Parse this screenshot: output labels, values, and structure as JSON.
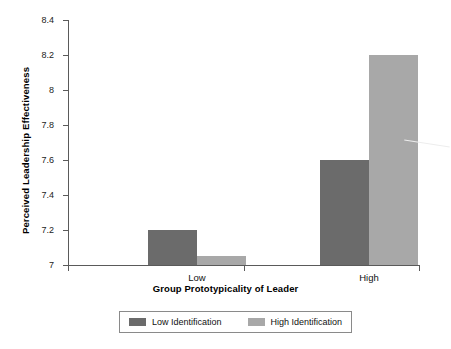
{
  "chart_data": {
    "type": "bar",
    "title": "",
    "xlabel": "Group Prototypicality of Leader",
    "ylabel": "Perceived Leadership Effectiveness",
    "categories": [
      "Low",
      "High"
    ],
    "series": [
      {
        "name": "Low Identification",
        "color": "#6b6b6b",
        "values": [
          7.2,
          7.6
        ]
      },
      {
        "name": "High Identification",
        "color": "#a8a8a8",
        "values": [
          7.05,
          8.2
        ]
      }
    ],
    "ylim": [
      7,
      8.4
    ],
    "ytick_labels": [
      "7",
      "7.2",
      "7.4",
      "7.6",
      "7.8",
      "8",
      "8.2",
      "8.4"
    ],
    "ytick_values": [
      7,
      7.2,
      7.4,
      7.6,
      7.8,
      8,
      8.2,
      8.4
    ],
    "grid": false,
    "legend_position": "bottom"
  },
  "legend": {
    "entries": [
      {
        "label": "Low Identification",
        "color": "#6b6b6b"
      },
      {
        "label": "High Identification",
        "color": "#a8a8a8"
      }
    ]
  }
}
